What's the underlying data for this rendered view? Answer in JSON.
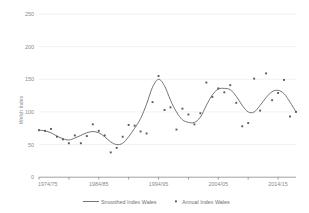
{
  "chart_data": {
    "type": "line",
    "title": "",
    "xlabel": "",
    "ylabel": "Welsh Index",
    "ylim": [
      0,
      250
    ],
    "yticks": [
      0,
      50,
      100,
      150,
      200,
      250
    ],
    "ytick_labels": [
      "0",
      "50",
      "100",
      "150",
      "200",
      "250"
    ],
    "xtick_labels": [
      "1974/75",
      "1984/85",
      "1994/95",
      "2004/05",
      "2014/15"
    ],
    "xtick_values": [
      "1974/75",
      "1984/85",
      "1994/95",
      "2004/05",
      "2014/15"
    ],
    "xlim": [
      "1974/75",
      "2017/18"
    ],
    "grid": "horizontal",
    "legend_position": "bottom",
    "legend": [
      "Smoothed Index Wales",
      "Annual Index Wales"
    ],
    "colors": {
      "line": "#6d6d6d",
      "points": "#5a5a5a",
      "grid": "#e2e2e2",
      "axis": "#7a7a7a",
      "text": "#8a8a8a",
      "background": "#ffffff"
    },
    "x": [
      "1974/75",
      "1975/76",
      "1976/77",
      "1977/78",
      "1978/79",
      "1979/80",
      "1980/81",
      "1981/82",
      "1982/83",
      "1983/84",
      "1984/85",
      "1985/86",
      "1986/87",
      "1987/88",
      "1988/89",
      "1989/90",
      "1990/91",
      "1991/92",
      "1992/93",
      "1993/94",
      "1994/95",
      "1995/96",
      "1996/97",
      "1997/98",
      "1998/99",
      "1999/00",
      "2000/01",
      "2001/02",
      "2002/03",
      "2003/04",
      "2004/05",
      "2005/06",
      "2006/07",
      "2007/08",
      "2008/09",
      "2009/10",
      "2010/11",
      "2011/12",
      "2012/13",
      "2013/14",
      "2014/15",
      "2015/16",
      "2016/17",
      "2017/18"
    ],
    "series": [
      {
        "name": "Annual Index Wales",
        "type": "scatter",
        "values": [
          72,
          71,
          74,
          62,
          58,
          52,
          64,
          52,
          63,
          81,
          71,
          64,
          38,
          45,
          62,
          80,
          79,
          70,
          67,
          115,
          155,
          103,
          107,
          73,
          105,
          96,
          81,
          98,
          145,
          123,
          136,
          130,
          141,
          114,
          78,
          83,
          151,
          102,
          159,
          118,
          129,
          149,
          93,
          100
        ]
      },
      {
        "name": "Smoothed Index Wales",
        "type": "line",
        "values": [
          72,
          71,
          68,
          63,
          59,
          57,
          60,
          64,
          68,
          70,
          68,
          62,
          54,
          50,
          52,
          62,
          75,
          90,
          112,
          138,
          150,
          140,
          118,
          100,
          88,
          84,
          84,
          92,
          110,
          126,
          135,
          136,
          134,
          124,
          110,
          100,
          100,
          110,
          122,
          131,
          133,
          128,
          115,
          100
        ]
      }
    ]
  }
}
